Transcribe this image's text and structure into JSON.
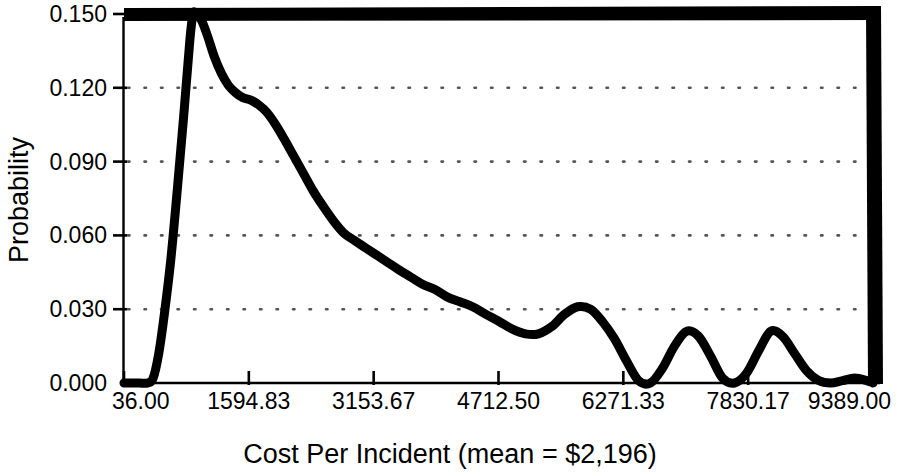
{
  "chart_data": {
    "type": "line",
    "title": "",
    "subtitle": "",
    "xlabel": "Cost Per Incident (mean = $2,196)",
    "ylabel": "Probability",
    "grid": true,
    "legend": null,
    "legend_position": "none",
    "xlim": [
      36.0,
      9389.0
    ],
    "ylim": [
      0.0,
      0.15
    ],
    "xticks": [
      36.0,
      1594.83,
      3153.67,
      4712.5,
      6271.33,
      7830.17,
      9389.0
    ],
    "xtick_labels": [
      "36.00",
      "1594.83",
      "3153.67",
      "4712.50",
      "6271.33",
      "7830.17",
      "9389.00"
    ],
    "yticks": [
      0.0,
      0.03,
      0.06,
      0.09,
      0.12,
      0.15
    ],
    "ytick_labels": [
      "0.000",
      "0.030",
      "0.060",
      "0.090",
      "0.120",
      "0.150"
    ],
    "annotations": [
      {
        "text": "mean = $2,196",
        "value": 2196
      }
    ],
    "series": [
      {
        "name": "Cost Per Incident probability density",
        "color": "#000000",
        "line_width": 9,
        "x": [
          36,
          120,
          230,
          330,
          400,
          470,
          540,
          620,
          700,
          780,
          860,
          900,
          950,
          1010,
          1080,
          1160,
          1250,
          1340,
          1430,
          1520,
          1620,
          1720,
          1820,
          1930,
          2040,
          2160,
          2280,
          2400,
          2520,
          2650,
          2780,
          2910,
          3050,
          3190,
          3330,
          3470,
          3620,
          3770,
          3920,
          4070,
          4230,
          4390,
          4550,
          4720,
          4880,
          5050,
          5210,
          5380,
          5540,
          5700,
          5860,
          6010,
          6160,
          6310,
          6460,
          6610,
          6760,
          6910,
          7060,
          7210,
          7360,
          7510,
          7660,
          7810,
          7960,
          8110,
          8260,
          8410,
          8560,
          8710,
          8860,
          9010,
          9160,
          9310,
          9389
        ],
        "y": [
          0.0,
          0.0,
          0.0,
          0.0,
          0.002,
          0.012,
          0.028,
          0.05,
          0.078,
          0.108,
          0.14,
          0.15,
          0.15,
          0.147,
          0.141,
          0.133,
          0.126,
          0.121,
          0.118,
          0.116,
          0.115,
          0.113,
          0.11,
          0.105,
          0.099,
          0.092,
          0.085,
          0.078,
          0.072,
          0.066,
          0.061,
          0.058,
          0.055,
          0.052,
          0.049,
          0.046,
          0.043,
          0.04,
          0.038,
          0.035,
          0.033,
          0.031,
          0.028,
          0.025,
          0.022,
          0.02,
          0.02,
          0.023,
          0.028,
          0.031,
          0.03,
          0.025,
          0.018,
          0.009,
          0.001,
          0.0,
          0.006,
          0.015,
          0.021,
          0.019,
          0.011,
          0.002,
          0.0,
          0.004,
          0.013,
          0.021,
          0.019,
          0.012,
          0.005,
          0.001,
          0.0,
          0.001,
          0.002,
          0.001,
          0.0
        ]
      }
    ],
    "frame": {
      "top_border": true,
      "right_border": true,
      "left_axis": true,
      "bottom_axis": true,
      "border_color": "#000000"
    }
  }
}
